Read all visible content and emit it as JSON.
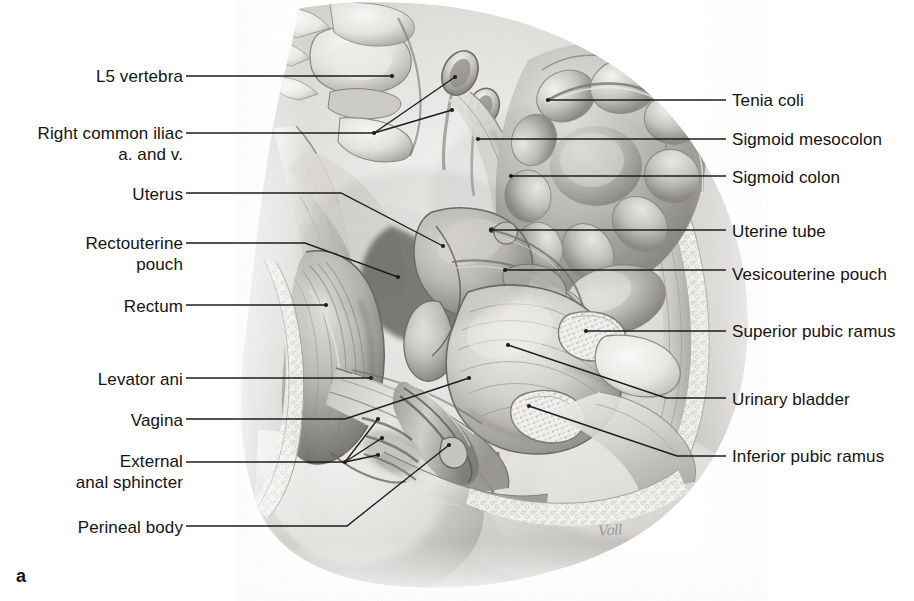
{
  "figure": {
    "panel_letter": "a",
    "artist_signature": "Voll",
    "illustration_description": "Grayscale pencil-rendered midsagittal section of the female pelvis"
  },
  "labels_left": [
    {
      "id": "l5-vertebra",
      "text": "L5 vertebra",
      "x": 183,
      "y": 76,
      "lines": 1
    },
    {
      "id": "right-common-iliac",
      "text": "Right common iliac\na. and v.",
      "x": 183,
      "y": 144,
      "lines": 2
    },
    {
      "id": "uterus",
      "text": "Uterus",
      "x": 183,
      "y": 194,
      "lines": 1
    },
    {
      "id": "rectouterine-pouch",
      "text": "Rectouterine\npouch",
      "x": 183,
      "y": 254,
      "lines": 2
    },
    {
      "id": "rectum",
      "text": "Rectum",
      "x": 183,
      "y": 306,
      "lines": 1
    },
    {
      "id": "levator-ani",
      "text": "Levator ani",
      "x": 183,
      "y": 379,
      "lines": 1
    },
    {
      "id": "vagina",
      "text": "Vagina",
      "x": 183,
      "y": 420,
      "lines": 1
    },
    {
      "id": "external-anal-sphincter",
      "text": "External\nanal sphincter",
      "x": 183,
      "y": 472,
      "lines": 2
    },
    {
      "id": "perineal-body",
      "text": "Perineal body",
      "x": 183,
      "y": 527,
      "lines": 1
    }
  ],
  "labels_right": [
    {
      "id": "tenia-coli",
      "text": "Tenia coli",
      "x": 732,
      "y": 100
    },
    {
      "id": "sigmoid-mesocolon",
      "text": "Sigmoid mesocolon",
      "x": 732,
      "y": 139
    },
    {
      "id": "sigmoid-colon",
      "text": "Sigmoid colon",
      "x": 732,
      "y": 177
    },
    {
      "id": "uterine-tube",
      "text": "Uterine tube",
      "x": 732,
      "y": 231
    },
    {
      "id": "vesicouterine-pouch",
      "text": "Vesicouterine pouch",
      "x": 732,
      "y": 274
    },
    {
      "id": "superior-pubic-ramus",
      "text": "Superior pubic ramus",
      "x": 732,
      "y": 331
    },
    {
      "id": "urinary-bladder",
      "text": "Urinary bladder",
      "x": 732,
      "y": 399
    },
    {
      "id": "inferior-pubic-ramus",
      "text": "Inferior pubic ramus",
      "x": 732,
      "y": 456
    }
  ],
  "leaders": [
    {
      "id": "leader-l5-vertebra",
      "points": "186,76 392,76"
    },
    {
      "id": "leader-right-common-iliac",
      "points": "186,133 374,133"
    },
    {
      "id": "leader-right-common-iliac-b1",
      "points": "374,133 455,77"
    },
    {
      "id": "leader-right-common-iliac-b2",
      "points": "374,133 452,110"
    },
    {
      "id": "leader-uterus",
      "points": "186,193 341,193 443,246"
    },
    {
      "id": "leader-rectouterine-pouch",
      "points": "186,243 305,243 398,277"
    },
    {
      "id": "leader-rectum",
      "points": "186,305 326,305"
    },
    {
      "id": "leader-levator-ani",
      "points": "186,378 371,378"
    },
    {
      "id": "leader-vagina",
      "points": "186,419 345,419 469,378"
    },
    {
      "id": "leader-eas",
      "points": "186,462 345,462"
    },
    {
      "id": "leader-eas-b1",
      "points": "345,462 378,419"
    },
    {
      "id": "leader-eas-b2",
      "points": "345,462 382,438"
    },
    {
      "id": "leader-eas-b3",
      "points": "345,462 378,455"
    },
    {
      "id": "leader-perineal-body",
      "points": "186,526 347,526 449,445"
    },
    {
      "id": "leader-tenia-coli",
      "points": "548,100 726,100"
    },
    {
      "id": "leader-sigmoid-mesocolon",
      "points": "478,139 726,139"
    },
    {
      "id": "leader-sigmoid-colon",
      "points": "511,176 726,176"
    },
    {
      "id": "leader-uterine-tube",
      "points": "491,230 726,230"
    },
    {
      "id": "leader-vesicouterine-pouch",
      "points": "505,270 726,270"
    },
    {
      "id": "leader-superior-pubic-ramus",
      "points": "586,331 726,331"
    },
    {
      "id": "leader-urinary-bladder",
      "points": "508,345 666,398 726,398"
    },
    {
      "id": "leader-inferior-pubic-ramus",
      "points": "529,406 677,456 726,456"
    }
  ],
  "colors": {
    "background": "#ffffff",
    "leader_line": "#1c1c1c",
    "label_text": "#131313",
    "art_light": "#f2f1ef",
    "art_mid": "#bdbcb8",
    "art_dark": "#6f6e6b",
    "art_darkest": "#3a3937",
    "signature": "#9a9a9a"
  }
}
